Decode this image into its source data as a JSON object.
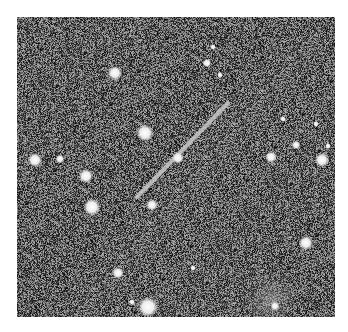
{
  "image": {
    "description": "Grayscale astronomical field with a diagonal streak (trail) across stars on a noisy background",
    "canvas": {
      "width": 348,
      "height": 332,
      "background": "#ffffff"
    },
    "field": {
      "x": 17,
      "y": 17,
      "width": 318,
      "height": 300,
      "noise_mean": 95,
      "noise_amplitude": 85
    },
    "streak": {
      "x1": 137,
      "y1": 197,
      "x2": 228,
      "y2": 103,
      "width": 4,
      "color": "#c8c8c8"
    },
    "stars": [
      {
        "x": 115,
        "y": 73,
        "r": 5
      },
      {
        "x": 145,
        "y": 133,
        "r": 6
      },
      {
        "x": 178,
        "y": 158,
        "r": 4
      },
      {
        "x": 35,
        "y": 160,
        "r": 5
      },
      {
        "x": 60,
        "y": 159,
        "r": 3
      },
      {
        "x": 86,
        "y": 176,
        "r": 5
      },
      {
        "x": 92,
        "y": 207,
        "r": 6
      },
      {
        "x": 152,
        "y": 205,
        "r": 4
      },
      {
        "x": 213,
        "y": 47,
        "r": 2
      },
      {
        "x": 207,
        "y": 63,
        "r": 3
      },
      {
        "x": 220,
        "y": 75,
        "r": 2
      },
      {
        "x": 283,
        "y": 119,
        "r": 2
      },
      {
        "x": 316,
        "y": 124,
        "r": 2
      },
      {
        "x": 296,
        "y": 145,
        "r": 3
      },
      {
        "x": 271,
        "y": 157,
        "r": 4
      },
      {
        "x": 322,
        "y": 160,
        "r": 5
      },
      {
        "x": 328,
        "y": 146,
        "r": 2
      },
      {
        "x": 306,
        "y": 243,
        "r": 5
      },
      {
        "x": 118,
        "y": 273,
        "r": 4
      },
      {
        "x": 193,
        "y": 268,
        "r": 2
      },
      {
        "x": 148,
        "y": 307,
        "r": 7
      },
      {
        "x": 132,
        "y": 302,
        "r": 2
      },
      {
        "x": 275,
        "y": 306,
        "r": 3
      }
    ],
    "glows": [
      {
        "x": 270,
        "y": 300,
        "r": 28
      }
    ]
  }
}
